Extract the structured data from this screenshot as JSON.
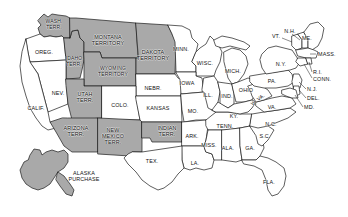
{
  "map": {
    "title": "United States map showing states and organized territories",
    "colors": {
      "state_fill": "#ffffff",
      "territory_fill": "#a9a9a9",
      "border": "#1a1a1a",
      "background": "#ffffff"
    },
    "legend_note": "Shaded gray areas are organized territories and the Alaska Purchase",
    "regions": [
      {
        "name": "washington-territory",
        "label": "WASH.\nTERR.",
        "type": "territory",
        "x": 54,
        "y": 25,
        "size": "small"
      },
      {
        "name": "oregon",
        "label": "OREG.",
        "type": "state",
        "x": 44,
        "y": 52,
        "size": "normal"
      },
      {
        "name": "idaho-territory",
        "label": "IDAHO\nTERR.",
        "type": "territory",
        "x": 74,
        "y": 62,
        "size": "small"
      },
      {
        "name": "montana-territory",
        "label": "MONTANA\nTERRITORY",
        "type": "territory",
        "x": 108,
        "y": 40,
        "size": "normal"
      },
      {
        "name": "wyoming-territory",
        "label": "WYOMING\nTERRITORY",
        "type": "territory",
        "x": 113,
        "y": 72,
        "size": "small"
      },
      {
        "name": "dakota-territory",
        "label": "DAKOTA\nTERRITORY",
        "type": "territory",
        "x": 153,
        "y": 55,
        "size": "normal"
      },
      {
        "name": "nebraska",
        "label": "NEBR.",
        "type": "state",
        "x": 153,
        "y": 88,
        "size": "normal"
      },
      {
        "name": "minnesota",
        "label": "MINN.",
        "type": "state",
        "x": 181,
        "y": 49,
        "size": "normal"
      },
      {
        "name": "wisconsin",
        "label": "WISC.",
        "type": "state",
        "x": 205,
        "y": 63,
        "size": "normal"
      },
      {
        "name": "iowa",
        "label": "IOWA",
        "type": "state",
        "x": 187,
        "y": 83,
        "size": "normal"
      },
      {
        "name": "michigan",
        "label": "MICH.",
        "type": "state",
        "x": 233,
        "y": 71,
        "size": "normal"
      },
      {
        "name": "illinois",
        "label": "ILL.",
        "type": "state",
        "x": 208,
        "y": 95,
        "size": "normal"
      },
      {
        "name": "indiana",
        "label": "IND.",
        "type": "state",
        "x": 227,
        "y": 96,
        "size": "normal"
      },
      {
        "name": "ohio",
        "label": "OHIO",
        "type": "state",
        "x": 246,
        "y": 90,
        "size": "normal"
      },
      {
        "name": "nevada",
        "label": "NEV.",
        "type": "state",
        "x": 58,
        "y": 93,
        "size": "normal"
      },
      {
        "name": "california",
        "label": "CALIF.",
        "type": "state",
        "x": 36,
        "y": 108,
        "size": "normal"
      },
      {
        "name": "utah-territory",
        "label": "UTAH\nTERR.",
        "type": "territory",
        "x": 85,
        "y": 97,
        "size": "normal"
      },
      {
        "name": "colorado",
        "label": "COLO.",
        "type": "state",
        "x": 120,
        "y": 105,
        "size": "normal"
      },
      {
        "name": "kansas",
        "label": "KANSAS",
        "type": "state",
        "x": 158,
        "y": 108,
        "size": "normal"
      },
      {
        "name": "missouri",
        "label": "MO.",
        "type": "state",
        "x": 193,
        "y": 111,
        "size": "normal"
      },
      {
        "name": "kentucky",
        "label": "KY.",
        "type": "state",
        "x": 234,
        "y": 116,
        "size": "normal"
      },
      {
        "name": "west-virginia",
        "label": "W. VA.",
        "type": "state",
        "x": 258,
        "y": 100,
        "size": "small"
      },
      {
        "name": "virginia",
        "label": "VA.",
        "type": "state",
        "x": 272,
        "y": 107,
        "size": "normal"
      },
      {
        "name": "pennsylvania",
        "label": "PA.",
        "type": "state",
        "x": 272,
        "y": 81,
        "size": "normal"
      },
      {
        "name": "new-york",
        "label": "N.Y.",
        "type": "state",
        "x": 281,
        "y": 64,
        "size": "normal"
      },
      {
        "name": "vermont",
        "label": "VT.",
        "type": "state",
        "x": 276,
        "y": 36,
        "size": "normal"
      },
      {
        "name": "new-hampshire",
        "label": "N.H.",
        "type": "state",
        "x": 290,
        "y": 31,
        "size": "normal"
      },
      {
        "name": "maine",
        "label": "ME.",
        "type": "state",
        "x": 307,
        "y": 38,
        "size": "normal"
      },
      {
        "name": "massachusetts",
        "label": "MASS.",
        "type": "state",
        "x": 322,
        "y": 54,
        "size": "normal"
      },
      {
        "name": "rhode-island",
        "label": "R.I.",
        "type": "state",
        "x": 318,
        "y": 72,
        "size": "normal"
      },
      {
        "name": "connecticut",
        "label": "CONN.",
        "type": "state",
        "x": 321,
        "y": 79,
        "size": "normal"
      },
      {
        "name": "new-jersey",
        "label": "N.J.",
        "type": "state",
        "x": 313,
        "y": 89,
        "size": "normal"
      },
      {
        "name": "delaware",
        "label": "DEL.",
        "type": "state",
        "x": 313,
        "y": 98,
        "size": "normal"
      },
      {
        "name": "maryland",
        "label": "MD.",
        "type": "state",
        "x": 310,
        "y": 107,
        "size": "normal"
      },
      {
        "name": "arizona-territory",
        "label": "ARIZONA\nTERR.",
        "type": "territory",
        "x": 76,
        "y": 131,
        "size": "normal"
      },
      {
        "name": "new-mexico-territory",
        "label": "NEW\nMEXICO\nTERR.",
        "type": "territory",
        "x": 113,
        "y": 136,
        "size": "normal"
      },
      {
        "name": "indian-territory",
        "label": "INDIAN\nTERR.",
        "type": "territory",
        "x": 167,
        "y": 131,
        "size": "normal"
      },
      {
        "name": "arkansas",
        "label": "ARK.",
        "type": "state",
        "x": 192,
        "y": 136,
        "size": "normal"
      },
      {
        "name": "tennessee",
        "label": "TENN.",
        "type": "state",
        "x": 225,
        "y": 126,
        "size": "normal"
      },
      {
        "name": "north-carolina",
        "label": "N.C.",
        "type": "state",
        "x": 271,
        "y": 124,
        "size": "normal"
      },
      {
        "name": "south-carolina",
        "label": "S.C.",
        "type": "state",
        "x": 265,
        "y": 136,
        "size": "normal"
      },
      {
        "name": "mississippi",
        "label": "MISS.",
        "type": "state",
        "x": 209,
        "y": 145,
        "size": "normal"
      },
      {
        "name": "alabama",
        "label": "ALA.",
        "type": "state",
        "x": 228,
        "y": 148,
        "size": "normal"
      },
      {
        "name": "georgia",
        "label": "GA.",
        "type": "state",
        "x": 250,
        "y": 148,
        "size": "normal"
      },
      {
        "name": "louisiana",
        "label": "LA.",
        "type": "state",
        "x": 195,
        "y": 163,
        "size": "normal"
      },
      {
        "name": "texas",
        "label": "TEX.",
        "type": "state",
        "x": 152,
        "y": 161,
        "size": "normal"
      },
      {
        "name": "florida",
        "label": "FLA.",
        "type": "state",
        "x": 269,
        "y": 182,
        "size": "normal"
      },
      {
        "name": "alaska-purchase",
        "label": "ALASKA\nPURCHASE",
        "type": "territory",
        "x": 84,
        "y": 176,
        "size": "normal"
      }
    ]
  }
}
